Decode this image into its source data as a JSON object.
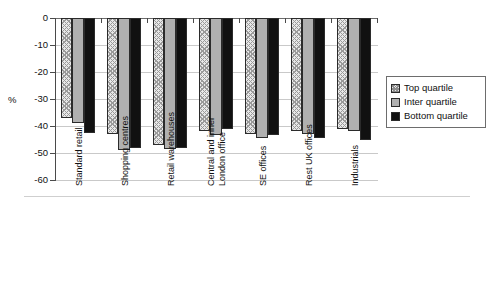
{
  "chart_data": {
    "type": "bar",
    "title": "",
    "subtitle": "",
    "xlabel": "",
    "ylabel": "%",
    "ylim": [
      -60,
      0
    ],
    "yticks": [
      0,
      -10,
      -20,
      -30,
      -40,
      -50,
      -60
    ],
    "ytick_labels": [
      "0",
      "-10",
      "-20",
      "-30",
      "-40",
      "-50",
      "-60"
    ],
    "grid": true,
    "legend_position": "right",
    "categories": [
      "Standard retail",
      "Shopping centres",
      "Retail warehouses",
      "Central and inner London office",
      "SE offices",
      "Rest UK offices",
      "Industrials"
    ],
    "category_lines": [
      [
        "Standard retail"
      ],
      [
        "Shopping centres"
      ],
      [
        "Retail warehouses"
      ],
      [
        "Central and inner",
        "London office"
      ],
      [
        "SE offices"
      ],
      [
        "Rest UK offices"
      ],
      [
        "Industrials"
      ]
    ],
    "series": [
      {
        "name": "Top quartile",
        "pattern": "hatched",
        "color": "#e8e8e8",
        "values": [
          -37.0,
          -43.0,
          -47.0,
          -42.0,
          -43.0,
          -42.0,
          -41.0
        ]
      },
      {
        "name": "Inter quartile",
        "pattern": "solid",
        "color": "#b0b0b0",
        "values": [
          -39.0,
          -48.8,
          -48.5,
          -43.5,
          -44.5,
          -43.0,
          -42.0
        ]
      },
      {
        "name": "Bottom quartile",
        "pattern": "solid",
        "color": "#111111",
        "values": [
          -42.5,
          -48.0,
          -48.0,
          -41.0,
          -43.5,
          -44.5,
          -45.0
        ]
      }
    ]
  },
  "axis": {
    "y_title": "%"
  },
  "legend": {
    "items": [
      {
        "label": "Top quartile",
        "swatch": "hatched-swatch"
      },
      {
        "label": "Inter quartile",
        "swatch": "gray-swatch"
      },
      {
        "label": "Bottom quartile",
        "swatch": "black-swatch"
      }
    ]
  }
}
